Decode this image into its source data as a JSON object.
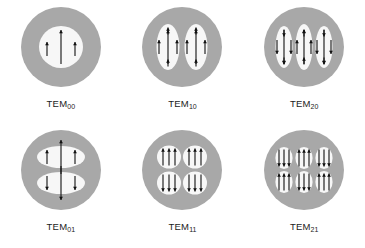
{
  "figure": {
    "background_color": "#ffffff",
    "disc_color": "#a8a8a8",
    "lobe_color": "#f7f7f7",
    "arrow_color": "#111111",
    "rows": 2,
    "columns": 3
  },
  "modes": [
    {
      "id": "tem00",
      "label_base": "TEM",
      "label_sub": "00",
      "indices": [
        0,
        0
      ],
      "lobe_count": 1,
      "lobe_layout": "1x1",
      "lobe_shape": "circle",
      "arrows": [
        {
          "lobe": 0,
          "direction": "up",
          "size": "long",
          "dx": 0,
          "dy": 0
        },
        {
          "lobe": 0,
          "direction": "up",
          "size": "short",
          "dx": -14,
          "dy": 2
        },
        {
          "lobe": 0,
          "direction": "up",
          "size": "short",
          "dx": 14,
          "dy": 2
        }
      ]
    },
    {
      "id": "tem10",
      "label_base": "TEM",
      "label_sub": "10",
      "indices": [
        1,
        0
      ],
      "lobe_count": 2,
      "lobe_layout": "2x1",
      "lobe_shape": "vertical-oval",
      "arrows": [
        {
          "lobe": 0,
          "direction": "up",
          "size": "long",
          "dx": 0,
          "dy": 0
        },
        {
          "lobe": 0,
          "direction": "up",
          "size": "short",
          "dx": -9,
          "dy": 0
        },
        {
          "lobe": 0,
          "direction": "up",
          "size": "short",
          "dx": 9,
          "dy": 0
        },
        {
          "lobe": 0,
          "direction": "up",
          "size": "tiny",
          "dx": 0,
          "dy": -16
        },
        {
          "lobe": 0,
          "direction": "up",
          "size": "tiny",
          "dx": 0,
          "dy": 16
        },
        {
          "lobe": 1,
          "direction": "up",
          "size": "long",
          "dx": 0,
          "dy": 0
        },
        {
          "lobe": 1,
          "direction": "up",
          "size": "short",
          "dx": -9,
          "dy": 0
        },
        {
          "lobe": 1,
          "direction": "up",
          "size": "short",
          "dx": 9,
          "dy": 0
        },
        {
          "lobe": 1,
          "direction": "up",
          "size": "tiny",
          "dx": 0,
          "dy": -16
        },
        {
          "lobe": 1,
          "direction": "up",
          "size": "tiny",
          "dx": 0,
          "dy": 16
        }
      ]
    },
    {
      "id": "tem20",
      "label_base": "TEM",
      "label_sub": "20",
      "indices": [
        2,
        0
      ],
      "lobe_count": 3,
      "lobe_layout": "3x1",
      "lobe_shape": "vertical-oval",
      "arrows": [
        {
          "lobe": 0,
          "direction": "down",
          "size": "long",
          "dx": 0,
          "dy": 0
        },
        {
          "lobe": 0,
          "direction": "down",
          "size": "short",
          "dx": -7,
          "dy": 0
        },
        {
          "lobe": 0,
          "direction": "down",
          "size": "short",
          "dx": 7,
          "dy": 0
        },
        {
          "lobe": 0,
          "direction": "down",
          "size": "tiny",
          "dx": 0,
          "dy": -14
        },
        {
          "lobe": 0,
          "direction": "down",
          "size": "tiny",
          "dx": 0,
          "dy": 14
        },
        {
          "lobe": 1,
          "direction": "up",
          "size": "long",
          "dx": 0,
          "dy": 0
        },
        {
          "lobe": 1,
          "direction": "up",
          "size": "short",
          "dx": -7,
          "dy": 0
        },
        {
          "lobe": 1,
          "direction": "up",
          "size": "short",
          "dx": 7,
          "dy": 0
        },
        {
          "lobe": 1,
          "direction": "up",
          "size": "tiny",
          "dx": 0,
          "dy": -14
        },
        {
          "lobe": 1,
          "direction": "up",
          "size": "tiny",
          "dx": 0,
          "dy": 14
        },
        {
          "lobe": 2,
          "direction": "down",
          "size": "long",
          "dx": 0,
          "dy": 0
        },
        {
          "lobe": 2,
          "direction": "down",
          "size": "short",
          "dx": -7,
          "dy": 0
        },
        {
          "lobe": 2,
          "direction": "down",
          "size": "short",
          "dx": 7,
          "dy": 0
        },
        {
          "lobe": 2,
          "direction": "down",
          "size": "tiny",
          "dx": 0,
          "dy": -14
        },
        {
          "lobe": 2,
          "direction": "down",
          "size": "tiny",
          "dx": 0,
          "dy": 14
        }
      ]
    },
    {
      "id": "tem01",
      "label_base": "TEM",
      "label_sub": "01",
      "indices": [
        0,
        1
      ],
      "lobe_count": 2,
      "lobe_layout": "1x2",
      "lobe_shape": "horizontal-oval",
      "arrows": [
        {
          "lobe": 0,
          "direction": "up",
          "size": "long",
          "dx": 0,
          "dy": 0
        },
        {
          "lobe": 0,
          "direction": "up",
          "size": "short",
          "dx": -14,
          "dy": 0
        },
        {
          "lobe": 0,
          "direction": "up",
          "size": "short",
          "dx": 14,
          "dy": 0
        },
        {
          "lobe": 1,
          "direction": "down",
          "size": "long",
          "dx": 0,
          "dy": 0
        },
        {
          "lobe": 1,
          "direction": "down",
          "size": "short",
          "dx": -14,
          "dy": 0
        },
        {
          "lobe": 1,
          "direction": "down",
          "size": "short",
          "dx": 14,
          "dy": 0
        }
      ]
    },
    {
      "id": "tem11",
      "label_base": "TEM",
      "label_sub": "11",
      "indices": [
        1,
        1
      ],
      "lobe_count": 4,
      "lobe_layout": "2x2",
      "lobe_shape": "blob",
      "arrows": [
        {
          "lobe": 0,
          "direction": "up",
          "size": "mid",
          "dx": -6,
          "dy": 0
        },
        {
          "lobe": 0,
          "direction": "up",
          "size": "mid",
          "dx": 0,
          "dy": 0
        },
        {
          "lobe": 0,
          "direction": "up",
          "size": "mid",
          "dx": 6,
          "dy": 0
        },
        {
          "lobe": 1,
          "direction": "up",
          "size": "mid",
          "dx": -6,
          "dy": 0
        },
        {
          "lobe": 1,
          "direction": "up",
          "size": "mid",
          "dx": 0,
          "dy": 0
        },
        {
          "lobe": 1,
          "direction": "up",
          "size": "mid",
          "dx": 6,
          "dy": 0
        },
        {
          "lobe": 2,
          "direction": "down",
          "size": "mid",
          "dx": -6,
          "dy": 0
        },
        {
          "lobe": 2,
          "direction": "down",
          "size": "mid",
          "dx": 0,
          "dy": 0
        },
        {
          "lobe": 2,
          "direction": "down",
          "size": "mid",
          "dx": 6,
          "dy": 0
        },
        {
          "lobe": 3,
          "direction": "down",
          "size": "mid",
          "dx": -6,
          "dy": 0
        },
        {
          "lobe": 3,
          "direction": "down",
          "size": "mid",
          "dx": 0,
          "dy": 0
        },
        {
          "lobe": 3,
          "direction": "down",
          "size": "mid",
          "dx": 6,
          "dy": 0
        }
      ]
    },
    {
      "id": "tem21",
      "label_base": "TEM",
      "label_sub": "21",
      "indices": [
        2,
        1
      ],
      "lobe_count": 6,
      "lobe_layout": "3x2",
      "lobe_shape": "blob",
      "arrows": [
        {
          "lobe": 0,
          "direction": "down",
          "size": "mid",
          "dx": -5,
          "dy": 0
        },
        {
          "lobe": 0,
          "direction": "down",
          "size": "mid",
          "dx": 0,
          "dy": 0
        },
        {
          "lobe": 0,
          "direction": "down",
          "size": "mid",
          "dx": 5,
          "dy": 0
        },
        {
          "lobe": 1,
          "direction": "up",
          "size": "mid",
          "dx": -5,
          "dy": 0
        },
        {
          "lobe": 1,
          "direction": "up",
          "size": "mid",
          "dx": 0,
          "dy": 0
        },
        {
          "lobe": 1,
          "direction": "up",
          "size": "mid",
          "dx": 5,
          "dy": 0
        },
        {
          "lobe": 2,
          "direction": "down",
          "size": "mid",
          "dx": -5,
          "dy": 0
        },
        {
          "lobe": 2,
          "direction": "down",
          "size": "mid",
          "dx": 0,
          "dy": 0
        },
        {
          "lobe": 2,
          "direction": "down",
          "size": "mid",
          "dx": 5,
          "dy": 0
        },
        {
          "lobe": 3,
          "direction": "up",
          "size": "mid",
          "dx": -5,
          "dy": 0
        },
        {
          "lobe": 3,
          "direction": "up",
          "size": "mid",
          "dx": 0,
          "dy": 0
        },
        {
          "lobe": 3,
          "direction": "up",
          "size": "mid",
          "dx": 5,
          "dy": 0
        },
        {
          "lobe": 4,
          "direction": "down",
          "size": "mid",
          "dx": -5,
          "dy": 0
        },
        {
          "lobe": 4,
          "direction": "down",
          "size": "mid",
          "dx": 0,
          "dy": 0
        },
        {
          "lobe": 4,
          "direction": "down",
          "size": "mid",
          "dx": 5,
          "dy": 0
        },
        {
          "lobe": 5,
          "direction": "up",
          "size": "mid",
          "dx": -5,
          "dy": 0
        },
        {
          "lobe": 5,
          "direction": "up",
          "size": "mid",
          "dx": 0,
          "dy": 0
        },
        {
          "lobe": 5,
          "direction": "up",
          "size": "mid",
          "dx": 5,
          "dy": 0
        }
      ]
    }
  ]
}
